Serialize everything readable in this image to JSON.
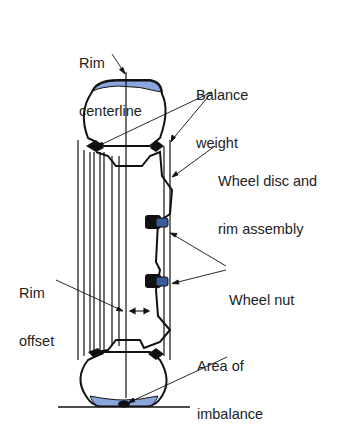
{
  "diagram": {
    "colors": {
      "tread_fill": "#8aa6dc",
      "line": "#111111",
      "nut_highlight": "#3a5a9a",
      "background": "#ffffff"
    },
    "labels": {
      "rim_centerline": {
        "line1": "Rim",
        "line2": "centerline"
      },
      "balance_weight": {
        "line1": "Balance",
        "line2": "weight"
      },
      "wheel_disc": {
        "line1": "Wheel disc and",
        "line2": "rim assembly"
      },
      "wheel_nut": {
        "line1": "Wheel nut"
      },
      "rim_offset": {
        "line1": "Rim",
        "line2": "offset"
      },
      "area_of_imbalance": {
        "line1": "Area of",
        "line2": "imbalance"
      }
    }
  }
}
